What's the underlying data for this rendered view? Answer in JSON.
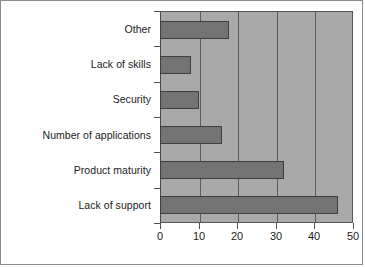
{
  "chart_data": {
    "type": "bar",
    "orientation": "horizontal",
    "title": "",
    "subtitle": "",
    "xlabel": "",
    "ylabel": "",
    "categories": [
      "Other",
      "Lack of skills",
      "Security",
      "Number of applications",
      "Product maturity",
      "Lack of support"
    ],
    "values": [
      18,
      8,
      10,
      16,
      32,
      46
    ],
    "xlim": [
      0,
      50
    ],
    "xticks": [
      0,
      10,
      20,
      30,
      40,
      50
    ],
    "xtick_labels": [
      "0",
      "10",
      "20",
      "30",
      "40",
      "50"
    ],
    "gridlines": {
      "vertical_at": [
        10,
        20,
        30,
        40
      ],
      "horizontal": false
    },
    "legend": {
      "visible": false,
      "entries": []
    },
    "colors": {
      "bar_fill": "#737373",
      "bar_border": "#3f3f3f",
      "plot_background": "#a9a9a9",
      "plot_border": "#575757",
      "gridline": "#5c5c5c",
      "canvas_background": "#ffffff",
      "frame_border": "#8a8a8a",
      "text": "#1b1b1b"
    },
    "annotations": []
  }
}
